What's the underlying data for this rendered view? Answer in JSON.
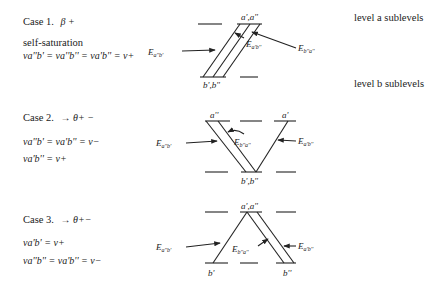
{
  "side_labels": {
    "level_a": "level a sublevels",
    "level_b": "level b sublevels"
  },
  "cases": [
    {
      "title": "Case 1.",
      "symbol": "β +",
      "note": "self-saturation",
      "equations": [
        "ν_{a''b'} = ν_{a''b''} = ν_{a'b''} = ν_+"
      ],
      "eq_text": [
        "νa''b' = νa''b'' = νa'b'' = ν+"
      ],
      "top_label": "a',a''",
      "bottom_label": "b',b''",
      "transitions": [
        "E_{a''b'}",
        "E_{a'b''}",
        "E_{b''a''}"
      ]
    },
    {
      "title": "Case 2.",
      "symbol": "→ θ+ −",
      "equations": [
        "ν_{a''b'} = ν_{a'b''} = ν_−",
        "ν_{a'b''} = ν_+"
      ],
      "eq_text": [
        "νa''b' = νa'b'' = ν−",
        "νa'b'' = ν+"
      ],
      "top_labels": [
        "a''",
        "a'"
      ],
      "bottom_label": "b',b''",
      "transitions": [
        "E_{a''b'}",
        "E_{b''a''}",
        "E_{a'b''}"
      ]
    },
    {
      "title": "Case 3.",
      "symbol": "→ θ+−",
      "equations": [
        "ν_{a'b'} = ν_+",
        "ν_{a''b''} = ν_{a'b''} = ν_−"
      ],
      "eq_text": [
        "νa'b' = ν+",
        "νa''b'' = νa'b'' = ν−"
      ],
      "top_label": "a',a''",
      "bottom_labels": [
        "b'",
        "b''"
      ],
      "transitions": [
        "E_{a''b'}",
        "E_{b''a''}",
        "E_{a'b''}"
      ]
    }
  ]
}
